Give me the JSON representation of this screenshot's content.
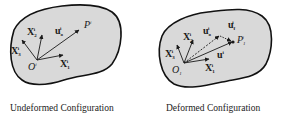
{
  "colors": {
    "fill": "#d9d9d9",
    "outline": "#111111",
    "vector": "#1a1a1a",
    "background": "#ffffff"
  },
  "panels": [
    {
      "name": "undeformed",
      "caption": "Undeformed Configuration",
      "origin_label": "O",
      "origin_sup": "i",
      "labels": {
        "x1": "X",
        "x1_sub": "1",
        "x1_sup": "i",
        "x2": "X",
        "x2_sub": "2",
        "x2_sup": "i",
        "x3": "X",
        "x3_sub": "3",
        "x3_sup": "i",
        "u0": "u",
        "u0_sub": "o",
        "u0_sup": "i",
        "p": "P",
        "p_sup": "i"
      }
    },
    {
      "name": "deformed",
      "caption": "Deformed Configuration",
      "origin_label": "O",
      "origin_sub": "1",
      "labels": {
        "x1": "X",
        "x1_sub": "1",
        "x1_sup": "i",
        "x2": "X",
        "x2_sub": "2",
        "x2_sup": "i",
        "x3": "X",
        "x3_sub": "3",
        "x3_sup": "i",
        "u0": "u",
        "u0_sub": "o",
        "u0_sup": "i",
        "uf": "u",
        "uf_sub": "f",
        "uf_sup": "i",
        "u": "u",
        "u_sup": "i",
        "p": "P",
        "p_sub": "1",
        "p_sup": "i"
      }
    }
  ]
}
